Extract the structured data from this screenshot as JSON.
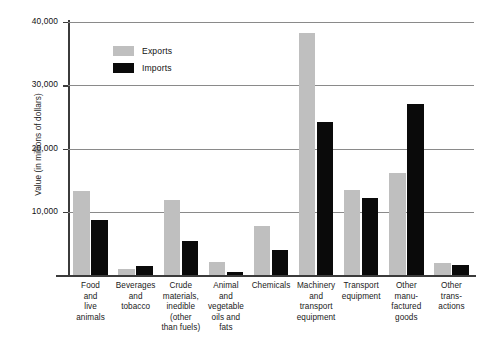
{
  "chart_data": {
    "type": "bar",
    "title": "",
    "xlabel": "",
    "ylabel": "Value (in millions of dollars)",
    "ylim": [
      0,
      40000
    ],
    "yticks": [
      0,
      10000,
      20000,
      30000,
      40000
    ],
    "ytick_labels": [
      "",
      "10,000",
      "20,000",
      "30,000",
      "40,000"
    ],
    "grid": true,
    "legend_position": "top-left-inside",
    "categories": [
      "Food and live animals",
      "Beverages and tobacco",
      "Crude materials, inedible (other than fuels)",
      "Animal and vegetable oils and fats",
      "Chemicals",
      "Machinery and transport equipment",
      "Transport equipment",
      "Other manufactured goods",
      "Other transactions"
    ],
    "category_lines": [
      [
        "Food",
        "and",
        "live",
        "animals"
      ],
      [
        "Beverages",
        "and",
        "tobacco"
      ],
      [
        "Crude",
        "materials,",
        "inedible",
        "(other",
        "than fuels)"
      ],
      [
        "Animal",
        "and",
        "vegetable",
        "oils and",
        "fats"
      ],
      [
        "Chemicals"
      ],
      [
        "Machinery",
        "and",
        "transport",
        "equipment"
      ],
      [
        "Transport",
        "equipment"
      ],
      [
        "Other",
        "manu-",
        "factured",
        "goods"
      ],
      [
        "Other",
        "trans-",
        "actions"
      ]
    ],
    "series": [
      {
        "name": "Exports",
        "color": "#bfbfbf",
        "values": [
          13300,
          1000,
          11900,
          2100,
          7800,
          38300,
          13500,
          16100,
          1900
        ]
      },
      {
        "name": "Imports",
        "color": "#0a0a0a",
        "values": [
          8700,
          1500,
          5300,
          500,
          4000,
          24200,
          12100,
          27000,
          1600
        ]
      }
    ]
  },
  "legend": {
    "items": [
      {
        "label": "Exports",
        "swatch": "exports"
      },
      {
        "label": "Imports",
        "swatch": "imports"
      }
    ]
  }
}
